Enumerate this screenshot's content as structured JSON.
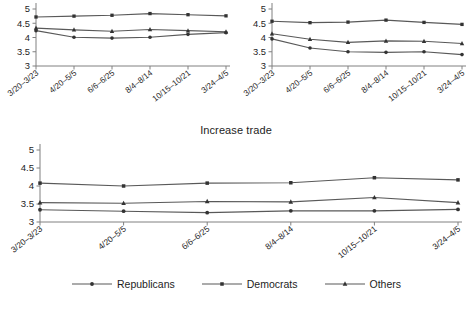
{
  "figure": {
    "background_color": "#ffffff",
    "line_color": "#595959",
    "marker_color": "#333333",
    "axis_color": "#808080",
    "text_color": "#1d1d1d"
  },
  "legend": {
    "position": "bottom-center",
    "entries": [
      {
        "label": "Republicans",
        "marker": "circle-marker"
      },
      {
        "label": "Democrats",
        "marker": "square-marker"
      },
      {
        "label": "Others",
        "marker": "triangle-marker"
      }
    ]
  },
  "chart_data": [
    {
      "id": "chart-top-left",
      "type": "line",
      "title": "",
      "xlabel": "",
      "ylabel": "",
      "ylim": [
        3,
        5
      ],
      "yticks": [
        3,
        3.5,
        4,
        4.5,
        5
      ],
      "ytick_labels": [
        "3",
        "3.5",
        "4",
        "4.5",
        "5"
      ],
      "grid": false,
      "categories": [
        "3/20-3/23",
        "4/20-5/5",
        "6/6-6/25",
        "8/4-8/14",
        "10/15-10/21",
        "3/24-4/5"
      ],
      "series": [
        {
          "name": "Republicans",
          "marker": "circle",
          "values": [
            4.24,
            4.01,
            3.98,
            4.01,
            4.11,
            4.17
          ]
        },
        {
          "name": "Democrats",
          "marker": "square",
          "values": [
            4.72,
            4.75,
            4.78,
            4.84,
            4.8,
            4.76
          ]
        },
        {
          "name": "Others",
          "marker": "triangle",
          "values": [
            4.33,
            4.27,
            4.22,
            4.28,
            4.24,
            4.2
          ]
        }
      ]
    },
    {
      "id": "chart-top-right",
      "type": "line",
      "title": "",
      "xlabel": "",
      "ylabel": "",
      "ylim": [
        3,
        5
      ],
      "yticks": [
        3,
        3.5,
        4,
        4.5,
        5
      ],
      "ytick_labels": [
        "3",
        "3.5",
        "4",
        "4.5",
        "5"
      ],
      "grid": false,
      "categories": [
        "3/20-3/23",
        "4/20-5/5",
        "6/6-6/25",
        "8/4-8/14",
        "10/15-10/21",
        "3/24-4/5"
      ],
      "series": [
        {
          "name": "Republicans",
          "marker": "circle",
          "values": [
            3.95,
            3.63,
            3.5,
            3.48,
            3.5,
            3.4
          ]
        },
        {
          "name": "Democrats",
          "marker": "square",
          "values": [
            4.57,
            4.52,
            4.54,
            4.61,
            4.53,
            4.46
          ]
        },
        {
          "name": "Others",
          "marker": "triangle",
          "values": [
            4.13,
            3.94,
            3.83,
            3.88,
            3.87,
            3.79
          ]
        }
      ]
    },
    {
      "id": "chart-bottom",
      "type": "line",
      "title": "Increase trade",
      "xlabel": "",
      "ylabel": "",
      "ylim": [
        3,
        5
      ],
      "yticks": [
        3,
        3.5,
        4,
        4.5,
        5
      ],
      "ytick_labels": [
        "3",
        "3.5",
        "4",
        "4.5",
        "5"
      ],
      "grid": false,
      "categories": [
        "3/20-3/23",
        "4/20-5/5",
        "6/6-6/25",
        "8/4-8/14",
        "10/15-10/21",
        "3/24-4/5"
      ],
      "series": [
        {
          "name": "Republicans",
          "marker": "circle",
          "values": [
            3.34,
            3.3,
            3.26,
            3.31,
            3.31,
            3.35
          ]
        },
        {
          "name": "Democrats",
          "marker": "square",
          "values": [
            4.08,
            4.0,
            4.08,
            4.09,
            4.23,
            4.17
          ]
        },
        {
          "name": "Others",
          "marker": "triangle",
          "values": [
            3.54,
            3.52,
            3.57,
            3.56,
            3.68,
            3.54
          ]
        }
      ]
    }
  ]
}
